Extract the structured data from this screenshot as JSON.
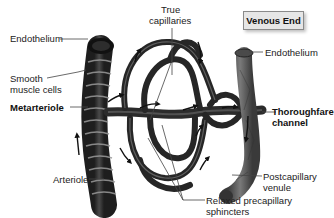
{
  "diagram": {
    "title_box": "Venous End",
    "labels": {
      "endothelium_left": "Endothelium",
      "smooth_muscle_line1": "Smooth",
      "smooth_muscle_line2": "muscle cells",
      "metarteriole": "Metarteriole",
      "arteriole": "Arteriole",
      "true_capillaries_line1": "True",
      "true_capillaries_line2": "capillaries",
      "endothelium_right": "Endothelium",
      "thoroughfare_line1": "Thoroughfare",
      "thoroughfare_line2": "channel",
      "postcapillary_line1": "Postcapillary",
      "postcapillary_line2": "venule",
      "sphincters_line1": "Relaxed precapillary",
      "sphincters_line2": "sphincters"
    },
    "colors": {
      "vessel_dark": "#2b2b2b",
      "vessel_mid": "#555555",
      "vessel_light": "#8a8a8a",
      "leader_line": "#444444",
      "title_box_bg": "#e6e6e6"
    }
  }
}
